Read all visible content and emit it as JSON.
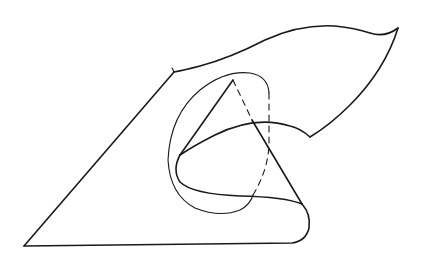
{
  "figure": {
    "stroke_color": "#1a1a1a",
    "background": "#ffffff"
  }
}
